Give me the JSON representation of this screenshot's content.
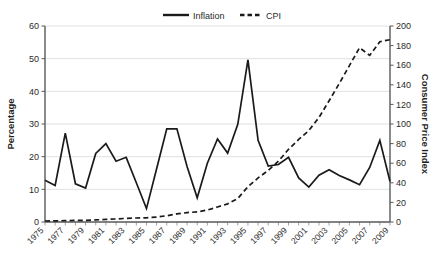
{
  "chart_data": {
    "type": "line",
    "title": "",
    "xlabel": "",
    "ylabel": "Percentage",
    "y2label": "Consumer Price Index",
    "grid": true,
    "legend_position": "top",
    "ylim": [
      0,
      60
    ],
    "y2lim": [
      0,
      200
    ],
    "yticks": [
      "0",
      "10",
      "20",
      "30",
      "40",
      "50",
      "60"
    ],
    "y2ticks": [
      "0",
      "20",
      "40",
      "60",
      "80",
      "100",
      "120",
      "140",
      "160",
      "180",
      "200"
    ],
    "x": [
      1975,
      1976,
      1977,
      1978,
      1979,
      1980,
      1981,
      1982,
      1983,
      1984,
      1985,
      1986,
      1987,
      1988,
      1989,
      1990,
      1991,
      1992,
      1993,
      1994,
      1995,
      1996,
      1997,
      1998,
      1999,
      2000,
      2001,
      2002,
      2003,
      2004,
      2005,
      2006,
      2007,
      2008,
      2009
    ],
    "xticks": [
      "1975",
      "1977",
      "1979",
      "1981",
      "1983",
      "1985",
      "1987",
      "1989",
      "1991",
      "1993",
      "1995",
      "1997",
      "1999",
      "2001",
      "2003",
      "2005",
      "2007",
      "2009"
    ],
    "series": [
      {
        "name": "Inflation",
        "axis": "left",
        "style": "solid",
        "values": [
          12.8,
          11.2,
          27.2,
          11.7,
          10.4,
          21.0,
          24.0,
          18.6,
          19.8,
          12.0,
          4.1,
          16.3,
          28.5,
          28.5,
          17.0,
          7.4,
          18.0,
          25.4,
          21.1,
          29.9,
          49.6,
          25.0,
          17.1,
          17.6,
          19.8,
          13.5,
          10.7,
          14.3,
          16.0,
          14.2,
          12.9,
          11.4,
          16.7,
          25.0,
          12.4
        ]
      },
      {
        "name": "CPI",
        "axis": "right",
        "style": "dashed",
        "values": [
          1.0,
          1.1,
          1.4,
          1.6,
          1.7,
          2.1,
          2.6,
          3.1,
          3.7,
          4.1,
          4.3,
          5.0,
          6.4,
          8.2,
          9.6,
          10.3,
          12.2,
          15.3,
          18.5,
          24.0,
          36.0,
          45.0,
          52.7,
          62.0,
          74.2,
          84.2,
          93.3,
          106.6,
          123.7,
          141.3,
          159.6,
          177.8,
          170.0,
          184.0,
          186.0
        ]
      }
    ]
  },
  "legend": {
    "items": [
      {
        "label": "Inflation",
        "style": "solid"
      },
      {
        "label": "CPI",
        "style": "dashed"
      }
    ]
  }
}
